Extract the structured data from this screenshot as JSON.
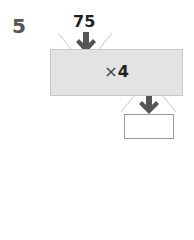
{
  "question": {
    "number": "5",
    "input_value": "75",
    "operation_symbol": "×",
    "operation_value": "4",
    "answer": ""
  },
  "colors": {
    "machine_fill": "#e3e3e3",
    "arrow": "#555555"
  }
}
